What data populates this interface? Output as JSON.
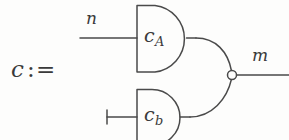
{
  "figure": {
    "name": "combinational-circuit-definition",
    "background_color": "#fdfdfc",
    "ink_color": "#4a4a4a",
    "width": 289,
    "height": 140
  },
  "definition": {
    "lhs": "c",
    "operator": ":=",
    "colon": ":",
    "equals": "="
  },
  "signals": {
    "input_top": {
      "label": "n",
      "wire_y": 38,
      "wire_x_start": 80,
      "wire_x_end": 136
    },
    "input_bottom": {
      "label": "",
      "terminator": "vertical-bar",
      "wire_y": 117,
      "wire_x_start": 107,
      "wire_x_end": 136
    },
    "output": {
      "label": "m",
      "wire_y": 75,
      "wire_x_start": 237,
      "wire_x_end": 289
    }
  },
  "gates": [
    {
      "id": "gate-a",
      "label_base": "c",
      "label_sub": "A",
      "shape": "d-shape-and-gate",
      "x": 136,
      "y": 5,
      "width": 50,
      "height": 67
    },
    {
      "id": "gate-b",
      "label_base": "c",
      "label_sub": "b",
      "shape": "d-shape-and-gate",
      "x": 136,
      "y": 89,
      "width": 44,
      "height": 56
    }
  ],
  "junction": {
    "name": "output-bubble",
    "type": "open-circle",
    "cx": 232,
    "cy": 75,
    "r": 4.5
  },
  "icons": {
    "gate_icon": "and-gate-icon",
    "terminal_icon": "terminal-bar-icon",
    "bubble_icon": "inverter-bubble-icon",
    "wire_icon": "wire-icon"
  }
}
